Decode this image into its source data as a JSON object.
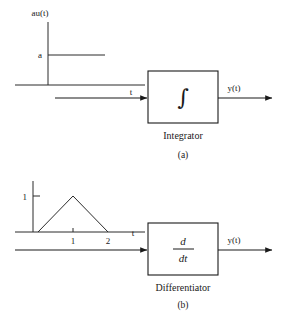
{
  "figure": {
    "background_color": "#ffffff",
    "ink_color": "#1a1a1a"
  },
  "panels": [
    {
      "id": "a",
      "caption": "(a)",
      "block_label": "Integrator",
      "operator_symbol": "∫",
      "operator_kind": "integral-sign",
      "input_plot": {
        "signal_label": "au(t)",
        "y_axis_tick_label": "a",
        "x_axis_label": "t",
        "waveform": "unit-step",
        "description": "step of amplitude a"
      },
      "output_label": "y(t)"
    },
    {
      "id": "b",
      "caption": "(b)",
      "block_label": "Differentiator",
      "operator_numerator": "d",
      "operator_denominator": "dt",
      "operator_kind": "derivative-fraction",
      "input_plot": {
        "y_axis_tick_label": "1",
        "x_axis_label": "t",
        "x_tick_labels": [
          "1",
          "2"
        ],
        "waveform": "triangular-pulse",
        "description": "triangle rising 0 to 1 over t=0..1, falling to 0 at t=2"
      },
      "output_label": "y(t)"
    }
  ]
}
